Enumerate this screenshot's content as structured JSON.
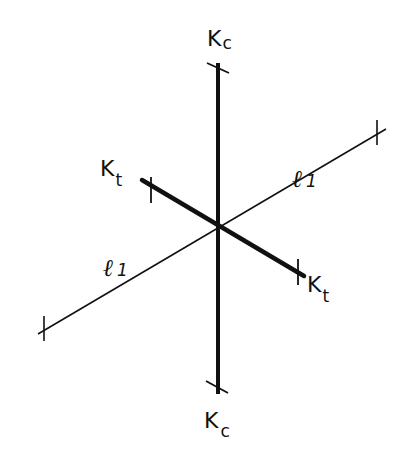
{
  "diagram": {
    "labels": {
      "kc_top": {
        "main": "K",
        "sub": "c"
      },
      "kc_bottom": {
        "main": "K",
        "sub": "c"
      },
      "kt_left": {
        "main": "K",
        "sub": "t"
      },
      "kt_right": {
        "main": "K",
        "sub": "t"
      },
      "l1_upper": {
        "main": "ℓ",
        "sub": "1"
      },
      "l1_lower": {
        "main": "ℓ",
        "sub": "1"
      }
    },
    "axes": [
      {
        "name": "Kc",
        "style": "thick",
        "from": [
          218,
          65
        ],
        "to": [
          218,
          392
        ]
      },
      {
        "name": "Kt",
        "style": "thick",
        "from": [
          143,
          181
        ],
        "to": [
          303,
          275
        ]
      },
      {
        "name": "l1",
        "style": "thin",
        "from": [
          40,
          332
        ],
        "to": [
          384,
          130
        ]
      }
    ],
    "colors": {
      "ink": "#111111",
      "background": "#ffffff"
    }
  }
}
